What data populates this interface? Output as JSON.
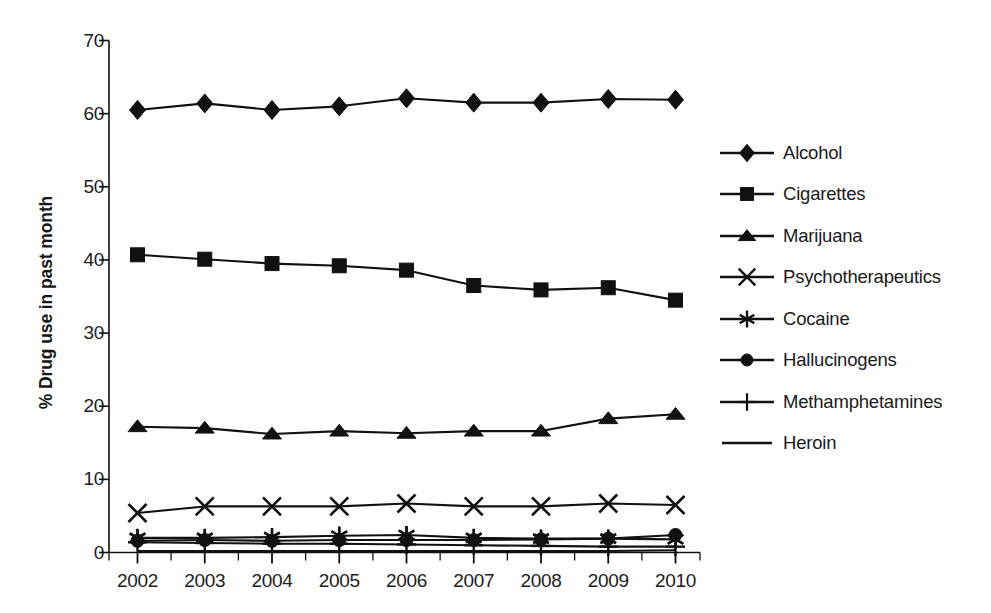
{
  "chart_data": {
    "type": "line",
    "title": "",
    "subtitle": "",
    "xlabel": "",
    "ylabel": "% Drug use in past month",
    "categories": [
      "2002",
      "2003",
      "2004",
      "2005",
      "2006",
      "2007",
      "2008",
      "2009",
      "2010"
    ],
    "x": [
      2002,
      2003,
      2004,
      2005,
      2006,
      2007,
      2008,
      2009,
      2010
    ],
    "xlim": [
      2002,
      2010
    ],
    "ylim": [
      0,
      70
    ],
    "yticks": [
      0,
      10,
      20,
      30,
      40,
      50,
      60,
      70
    ],
    "ytick_labels": [
      "0",
      "10",
      "20",
      "30",
      "40",
      "50",
      "60",
      "70"
    ],
    "grid": false,
    "legend_position": "right",
    "line_color": "#111111",
    "series": [
      {
        "name": "Alcohol",
        "marker": "diamond",
        "values": [
          60.5,
          61.4,
          60.5,
          61.0,
          62.1,
          61.5,
          61.5,
          62.0,
          61.9
        ]
      },
      {
        "name": "Cigarettes",
        "marker": "square",
        "values": [
          40.7,
          40.1,
          39.5,
          39.2,
          38.6,
          36.5,
          35.9,
          36.2,
          34.5
        ]
      },
      {
        "name": "Marijuana",
        "marker": "triangle",
        "values": [
          17.2,
          17.0,
          16.2,
          16.6,
          16.3,
          16.6,
          16.6,
          18.3,
          18.9
        ]
      },
      {
        "name": "Psychotherapeutics",
        "marker": "cross",
        "values": [
          5.4,
          6.3,
          6.3,
          6.3,
          6.7,
          6.3,
          6.3,
          6.7,
          6.5
        ]
      },
      {
        "name": "Cocaine",
        "marker": "asterisk",
        "values": [
          2.0,
          2.0,
          2.1,
          2.3,
          2.4,
          2.0,
          1.9,
          1.9,
          1.8
        ]
      },
      {
        "name": "Hallucinogens",
        "marker": "circle",
        "values": [
          1.6,
          1.7,
          1.6,
          1.7,
          1.7,
          1.7,
          1.8,
          1.9,
          2.4
        ]
      },
      {
        "name": "Methamphetamines",
        "marker": "plus",
        "values": [
          1.4,
          1.3,
          1.2,
          1.2,
          1.1,
          1.0,
          0.9,
          0.8,
          0.8
        ]
      },
      {
        "name": "Heroin",
        "marker": "line",
        "values": [
          0.2,
          0.2,
          0.2,
          0.2,
          0.2,
          0.2,
          0.2,
          0.2,
          0.3
        ]
      }
    ]
  },
  "axis": {
    "y_title": "% Drug use in past month",
    "y_labels": [
      "70",
      "60",
      "50",
      "40",
      "30",
      "20",
      "10",
      "0"
    ],
    "x_labels": [
      "2002",
      "2003",
      "2004",
      "2005",
      "2006",
      "2007",
      "2008",
      "2009",
      "2010"
    ]
  },
  "legend": {
    "items": [
      {
        "label": "Alcohol",
        "marker": "diamond-marker"
      },
      {
        "label": "Cigarettes",
        "marker": "square-marker"
      },
      {
        "label": "Marijuana",
        "marker": "triangle-marker"
      },
      {
        "label": "Psychotherapeutics",
        "marker": "cross-marker"
      },
      {
        "label": "Cocaine",
        "marker": "asterisk-marker"
      },
      {
        "label": "Hallucinogens",
        "marker": "circle-marker"
      },
      {
        "label": "Methamphetamines",
        "marker": "plus-marker"
      },
      {
        "label": "Heroin",
        "marker": "line-marker"
      }
    ]
  }
}
